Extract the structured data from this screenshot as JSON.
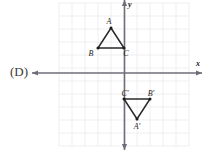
{
  "choice": {
    "label": "(D)"
  },
  "axes": {
    "x_label": "x",
    "y_label": "y",
    "x_axis_y_px": 73,
    "y_axis_x_px": 124.5,
    "color": "#6e6e78"
  },
  "grid": {
    "cell_px": 13,
    "left_px": 59,
    "top_px": 3,
    "right_px": 189,
    "bottom_px": 146,
    "color": "#eceaee"
  },
  "chart_data": {
    "type": "scatter",
    "title": "",
    "xlabel": "x",
    "ylabel": "y",
    "grid": true,
    "legend": "none",
    "xlim": [
      -5,
      5
    ],
    "ylim": [
      -5.6,
      5.4
    ],
    "annotations": [
      "(D)"
    ],
    "series": [
      {
        "name": "Triangle ABC",
        "closed": true,
        "points": [
          {
            "label": "A",
            "x": -1,
            "y": 3.5,
            "px": 111,
            "py": 28,
            "label_dx": -2,
            "label_dy": -4
          },
          {
            "label": "B",
            "x": -2,
            "y": 2,
            "px": 98,
            "py": 48,
            "label_dx": -7,
            "label_dy": 8
          },
          {
            "label": "C",
            "x": 0,
            "y": 2,
            "px": 124,
            "py": 48,
            "label_dx": 2,
            "label_dy": 8
          }
        ]
      },
      {
        "name": "Triangle A'B'C'",
        "closed": true,
        "points": [
          {
            "label": "C'",
            "x": 0,
            "y": -2,
            "px": 124,
            "py": 99,
            "label_dx": 1,
            "label_dy": -3
          },
          {
            "label": "B'",
            "x": 2,
            "y": -2,
            "px": 150,
            "py": 99,
            "label_dx": 1,
            "label_dy": -3
          },
          {
            "label": "A'",
            "x": 1,
            "y": -3.5,
            "px": 137,
            "py": 119,
            "label_dx": 0,
            "label_dy": 10
          }
        ]
      }
    ]
  }
}
